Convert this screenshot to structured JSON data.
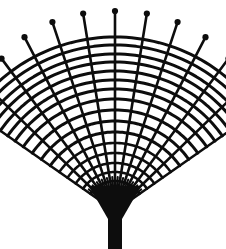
{
  "image": {
    "title": "Woven fan illustration",
    "subject": "hand fan",
    "style": "black and white line drawing",
    "width": 226,
    "height": 249
  },
  "colors": {
    "ink": "#0d0d0d",
    "background": "#ffffff"
  },
  "geometry": {
    "pivot_x": 115,
    "pivot_y": 211,
    "angle_start_deg": -145,
    "angle_end_deg": -35,
    "rib_count": 13,
    "rib_tip_radius_min": 176,
    "rib_tip_radius_max": 200,
    "arc_count": 16,
    "knob_radius": 3.1,
    "rib_stroke_width": 2.6,
    "arc_stroke_width": 3.0
  },
  "rib_tip_radii": [
    176,
    183,
    190,
    196,
    199,
    200,
    200,
    200,
    199,
    196,
    190,
    183,
    176
  ],
  "arc_radii": [
    30,
    39,
    48,
    58,
    68,
    79,
    90,
    101,
    112,
    122,
    131,
    140,
    149,
    157,
    166,
    174
  ],
  "handle": {
    "wedge_top_half_width": 26,
    "wedge_top_y": 186,
    "wedge_bottom_y": 219,
    "shaft_half_width": 7,
    "shaft_bottom_y": 249
  },
  "labels": {
    "figure_caption": ""
  }
}
